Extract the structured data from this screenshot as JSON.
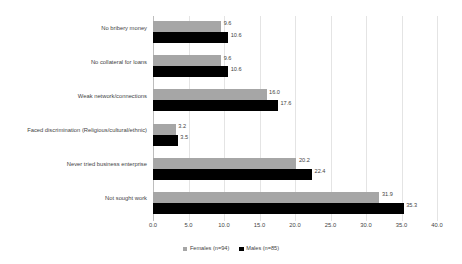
{
  "chart_data": {
    "type": "bar",
    "orientation": "horizontal",
    "title": "",
    "subtitle": "",
    "xlabel": "",
    "ylabel": "",
    "xlim": [
      0.0,
      40.0
    ],
    "xticks": [
      "0.0",
      "5.0",
      "10.0",
      "15.0",
      "20.0",
      "25.0",
      "30.0",
      "35.0",
      "40.0"
    ],
    "xtick_values": [
      0,
      5,
      10,
      15,
      20,
      25,
      30,
      35,
      40
    ],
    "grid": "vertical",
    "legend_position": "bottom-center",
    "categories": [
      "No bribery money",
      "No collateral for loans",
      "Weak network/connections",
      "Faced discrimination (Religious/cultural/ethnic)",
      "Never tried business enterprise",
      "Not sought work"
    ],
    "series": [
      {
        "name": "Females (n=94)",
        "color": "#a6a6a6",
        "values": [
          9.6,
          9.6,
          16.0,
          3.2,
          20.2,
          31.9
        ],
        "labels": [
          "9.6",
          "9.6",
          "16.0",
          "3.2",
          "20.2",
          "31.9"
        ]
      },
      {
        "name": "Males (n=85)",
        "color": "#000000",
        "values": [
          10.6,
          10.6,
          17.6,
          3.5,
          22.4,
          35.3
        ],
        "labels": [
          "10.6",
          "10.6",
          "17.6",
          "3.5",
          "22.4",
          "35.3"
        ]
      }
    ],
    "legend": [
      {
        "label": "Females (n=94)",
        "color": "#a6a6a6"
      },
      {
        "label": "Males (n=85)",
        "color": "#000000"
      }
    ]
  }
}
